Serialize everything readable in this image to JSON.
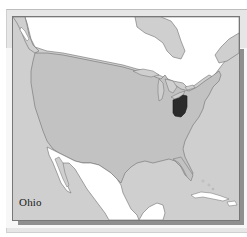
{
  "map": {
    "title": "Ohio",
    "highlighted_region": "Ohio",
    "regions": [
      {
        "name": "United States",
        "fill": "#c2c2c2"
      },
      {
        "name": "Ohio",
        "fill": "#2b2b2b",
        "highlighted": true
      },
      {
        "name": "Canada",
        "fill": "#ffffff"
      },
      {
        "name": "Mexico",
        "fill": "#ffffff"
      },
      {
        "name": "Cuba",
        "fill": "#ffffff"
      }
    ],
    "colors": {
      "water": "#cfcfcf",
      "us_land": "#c2c2c2",
      "foreign_land": "#ffffff",
      "highlight": "#2b2b2b",
      "coastline": "#6e6e6e",
      "frame_border": "#777777",
      "frame_shadow": "#8f8f8f"
    }
  }
}
